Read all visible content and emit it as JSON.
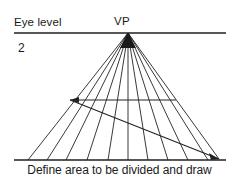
{
  "figure": {
    "title_eye_level": "Eye level",
    "vanishing_point_label": "VP",
    "step_number": "2",
    "caption": "Define area to be divided and draw",
    "colors": {
      "ink": "#1a1a1a",
      "line": "#222222",
      "background": "#ffffff"
    },
    "geometry": {
      "horizon_line": {
        "x1": 14,
        "y1": 33,
        "x2": 226,
        "y2": 33
      },
      "ground_line": {
        "x1": 14,
        "y1": 160,
        "x2": 226,
        "y2": 160
      },
      "vanishing_point": {
        "x": 128,
        "y": 33
      },
      "measure_line": {
        "x1": 70,
        "y1": 100,
        "x2": 176,
        "y2": 100,
        "arrow": "left"
      },
      "diagonal_line": {
        "x1": 70,
        "y1": 100,
        "x2": 219,
        "y2": 159,
        "arrow": "right"
      },
      "ray_ground_endpoints": [
        28,
        47,
        66,
        87,
        108,
        128,
        148,
        168,
        188,
        208,
        219
      ]
    }
  }
}
